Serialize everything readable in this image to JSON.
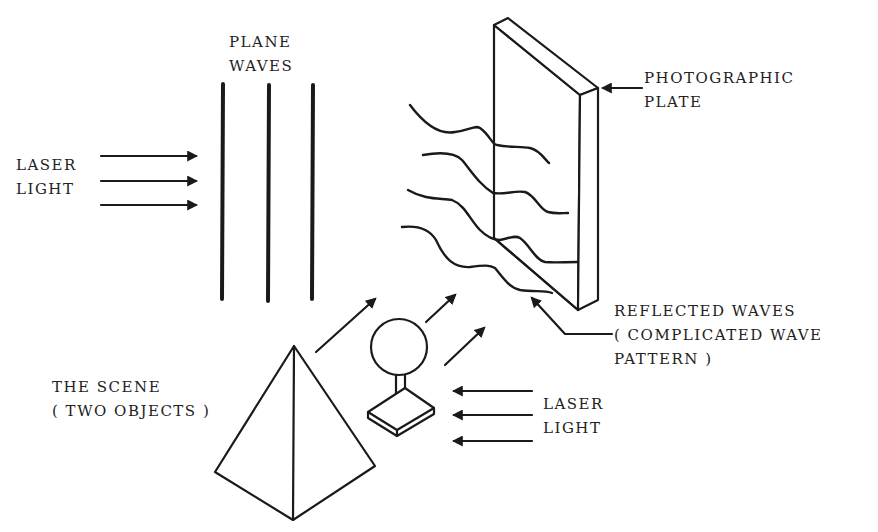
{
  "colors": {
    "ink": "#1a1a1a",
    "background": "#ffffff",
    "text": "#222222"
  },
  "labels": {
    "plane_waves": [
      "PLANE",
      "WAVES"
    ],
    "laser_light_left": [
      "LASER",
      "LIGHT"
    ],
    "photographic_plate": [
      "PHOTOGRAPHIC",
      "PLATE"
    ],
    "reflected_waves": [
      "REFLECTED WAVES",
      "( COMPLICATED WAVE",
      "PATTERN )"
    ],
    "scene": [
      "THE SCENE",
      "( TWO OBJECTS )"
    ],
    "laser_light_right": [
      "LASER",
      "LIGHT"
    ]
  },
  "elements": {
    "plane_wavefronts": 3,
    "incoming_laser_arrows_left": 3,
    "incoming_laser_arrows_right": 3,
    "reflected_arrows": 3,
    "reflected_wave_curves": 4,
    "objects": [
      "pyramid",
      "sphere-on-stand"
    ]
  }
}
